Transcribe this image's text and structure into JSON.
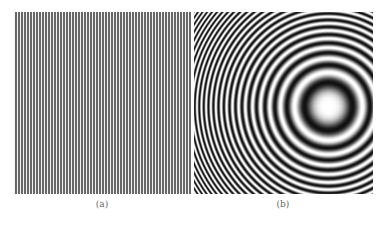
{
  "figure": {
    "panels": [
      {
        "id": "a",
        "caption": "(a)",
        "pattern": "vertical-grating",
        "description": "Vertical black and white line grating",
        "period_px": 3,
        "colors": {
          "dark": "#3a3a3a",
          "light": "#f2f2f2"
        }
      },
      {
        "id": "b",
        "caption": "(b)",
        "pattern": "zone-plate-rings",
        "description": "Concentric chirped circular fringes (Fresnel zone plate), center offset to the right",
        "center_px": [
          134,
          94
        ],
        "chirp_coefficient": 0.00545,
        "colors": {
          "dark": "#111111",
          "light": "#ffffff"
        }
      }
    ]
  }
}
